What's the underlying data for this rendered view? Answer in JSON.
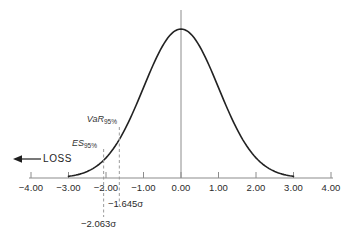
{
  "chart_data": {
    "type": "line",
    "title": "",
    "x_ticks": [
      "−4.00",
      "−3.00",
      "−2.00",
      "−1.00",
      "0.00",
      "1.00",
      "2.00",
      "3.00",
      "4.00"
    ],
    "x_tick_values": [
      -4,
      -3,
      -2,
      -1,
      0,
      1,
      2,
      3,
      4
    ],
    "xlim": [
      -4,
      4
    ],
    "grid": false,
    "legend": false,
    "curve": {
      "distribution": "standard-normal",
      "mean": 0,
      "sigma": 1,
      "x_range": [
        -3,
        3
      ]
    },
    "center_line_x": 0,
    "annotations": {
      "var": {
        "label": "VaR",
        "sub": "95%",
        "x": -1.645,
        "sigma_label": "−1.645σ",
        "line_style": "dashed"
      },
      "es": {
        "label": "ES",
        "sub": "95%",
        "x": -2.063,
        "sigma_label": "−2.063σ",
        "line_style": "dashed"
      },
      "loss": {
        "label": "LOSS",
        "direction": "left"
      }
    },
    "colors": {
      "curve": "#222222",
      "axis": "#8c8c8c",
      "dashed": "#9b9b9b",
      "text": "#2b2b2b",
      "arrow": "#1e1e1e",
      "background": "#ffffff"
    }
  }
}
